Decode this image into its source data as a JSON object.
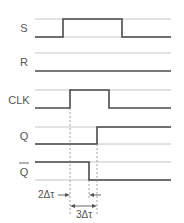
{
  "diagram": {
    "type": "timing-diagram",
    "signals": [
      {
        "name": "S",
        "label": "S",
        "overbar": false
      },
      {
        "name": "R",
        "label": "R",
        "overbar": false
      },
      {
        "name": "CLK",
        "label": "CLK",
        "overbar": false
      },
      {
        "name": "Q",
        "label": "Q",
        "overbar": false
      },
      {
        "name": "Q_bar",
        "label": "Q",
        "overbar": true
      }
    ],
    "annotations": {
      "delay_2": "2Δτ",
      "delay_3": "3Δτ"
    },
    "colors": {
      "signal": "#4a4a4a",
      "guide": "#c4c4c4",
      "dashed": "#8a8a8a",
      "text": "#555555"
    }
  }
}
